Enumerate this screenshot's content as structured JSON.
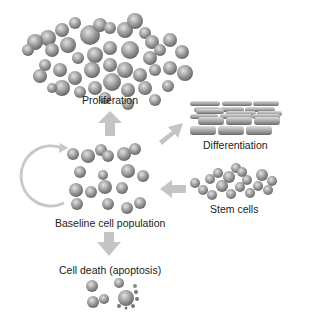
{
  "labels": {
    "proliferation": "Proliferation",
    "differentiation": "Differentiation",
    "baseline": "Baseline cell population",
    "stem_cells": "Stem cells",
    "cell_death": "Cell death (apoptosis)"
  },
  "colors": {
    "cell": "#8e8e8e",
    "cell_highlight": "#d6d6d6",
    "arrow": "#c4c4c4",
    "text": "#222222"
  }
}
